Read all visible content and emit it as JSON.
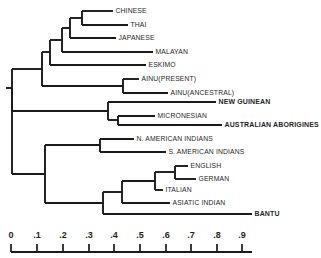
{
  "figure": {
    "type": "dendrogram"
  },
  "chart_data": {
    "type": "tree",
    "title": "",
    "xlabel": "",
    "ylabel": "",
    "xlim": [
      0,
      0.95
    ],
    "grid": false,
    "legend": null,
    "axis": {
      "tick_labels": [
        "0",
        ".1",
        ".2",
        ".3",
        ".4",
        ".5",
        ".6",
        ".7",
        ".8",
        ".9"
      ],
      "tick_values": [
        0,
        0.1,
        0.2,
        0.3,
        0.4,
        0.5,
        0.6,
        0.7,
        0.8,
        0.9
      ],
      "tick_px": [
        11,
        37,
        63,
        89,
        114,
        140,
        166,
        191,
        217,
        242
      ],
      "line_start_px": 11,
      "line_end_px": 252,
      "line_y_px": 252,
      "label_y_px": 238,
      "tick_top_px": 244,
      "tick_bottom_px": 252
    },
    "leaves": [
      {
        "label": "CHINESE",
        "y": 11,
        "x_end": 113,
        "bold": false
      },
      {
        "label": "THAI",
        "y": 25,
        "x_end": 128,
        "bold": false
      },
      {
        "label": "JAPANESE",
        "y": 38,
        "x_end": 116,
        "bold": false
      },
      {
        "label": "MALAYAN",
        "y": 52,
        "x_end": 153,
        "bold": false
      },
      {
        "label": "ESKIMO",
        "y": 65,
        "x_end": 146,
        "bold": false
      },
      {
        "label": "AINU(PRESENT)",
        "y": 79,
        "x_end": 139,
        "bold": false
      },
      {
        "label": "AINU(ANCESTRAL)",
        "y": 93,
        "x_end": 168,
        "bold": false
      },
      {
        "label": "NEW GUINEAN",
        "y": 102,
        "x_end": 216,
        "bold": true
      },
      {
        "label": "MICRONESIAN",
        "y": 116,
        "x_end": 155,
        "bold": false
      },
      {
        "label": "AUSTRALIAN ABORIGINES",
        "y": 125,
        "x_end": 222,
        "bold": true
      },
      {
        "label": "N. AMERICAN INDIANS",
        "y": 139,
        "x_end": 134,
        "bold": false
      },
      {
        "label": "S. AMERICAN INDIANS",
        "y": 152,
        "x_end": 166,
        "bold": false
      },
      {
        "label": "ENGLISH",
        "y": 166,
        "x_end": 188,
        "bold": false
      },
      {
        "label": "GERMAN",
        "y": 179,
        "x_end": 196,
        "bold": false
      },
      {
        "label": "ITALIAN",
        "y": 190,
        "x_end": 163,
        "bold": false
      },
      {
        "label": "ASIATIC INDIAN",
        "y": 203,
        "x_end": 170,
        "bold": false
      },
      {
        "label": "BANTU",
        "y": 214,
        "x_end": 252,
        "bold": true
      }
    ],
    "nodes": [
      {
        "name": "chinese-thai",
        "x": 82,
        "y_top": 11,
        "y_bot": 25
      },
      {
        "name": "chinese-thai-japanese",
        "x": 70,
        "y_top": 18,
        "y_bot": 38
      },
      {
        "name": "east-asian-malayan",
        "x": 62,
        "y_top": 28,
        "y_bot": 52
      },
      {
        "name": "asian-eskimo",
        "x": 50,
        "y_top": 40,
        "y_bot": 65
      },
      {
        "name": "ainu-pair",
        "x": 123,
        "y_top": 79,
        "y_bot": 93
      },
      {
        "name": "asian-ainu",
        "x": 42,
        "y_top": 52,
        "y_bot": 86
      },
      {
        "name": "micronesian-australian",
        "x": 118,
        "y_top": 116,
        "y_bot": 125
      },
      {
        "name": "oceanic",
        "x": 108,
        "y_top": 102,
        "y_bot": 120
      },
      {
        "name": "asian-oceanic",
        "x": 12,
        "y_top": 69,
        "y_bot": 111
      },
      {
        "name": "american-indians",
        "x": 100,
        "y_top": 139,
        "y_bot": 152
      },
      {
        "name": "english-german",
        "x": 175,
        "y_top": 166,
        "y_bot": 179
      },
      {
        "name": "euro-italian",
        "x": 155,
        "y_top": 172,
        "y_bot": 190
      },
      {
        "name": "euro-asiatic-indian",
        "x": 122,
        "y_top": 181,
        "y_bot": 203
      },
      {
        "name": "euro-bantu",
        "x": 103,
        "y_top": 192,
        "y_bot": 214
      },
      {
        "name": "american-euro",
        "x": 45,
        "y_top": 145,
        "y_bot": 203
      },
      {
        "name": "root",
        "x": 12,
        "y_top": 88,
        "y_bot": 174
      }
    ],
    "branches": [
      {
        "name": "chinese-leaf",
        "y": 11,
        "x_from": 82,
        "x_to": 113
      },
      {
        "name": "thai-leaf",
        "y": 25,
        "x_from": 82,
        "x_to": 128
      },
      {
        "name": "chinese-thai-stem",
        "y": 18,
        "x_from": 70,
        "x_to": 82
      },
      {
        "name": "japanese-leaf",
        "y": 38,
        "x_from": 70,
        "x_to": 116
      },
      {
        "name": "japanese-grp-stem",
        "y": 28,
        "x_from": 62,
        "x_to": 70
      },
      {
        "name": "malayan-leaf",
        "y": 52,
        "x_from": 62,
        "x_to": 153
      },
      {
        "name": "malayan-grp-stem",
        "y": 40,
        "x_from": 50,
        "x_to": 62
      },
      {
        "name": "eskimo-leaf",
        "y": 65,
        "x_from": 50,
        "x_to": 146
      },
      {
        "name": "eskimo-grp-stem",
        "y": 52,
        "x_from": 42,
        "x_to": 50
      },
      {
        "name": "ainu-present-leaf",
        "y": 79,
        "x_from": 123,
        "x_to": 139
      },
      {
        "name": "ainu-ancestral-leaf",
        "y": 93,
        "x_from": 123,
        "x_to": 168
      },
      {
        "name": "ainu-stem",
        "y": 86,
        "x_from": 42,
        "x_to": 123
      },
      {
        "name": "asian-stem",
        "y": 69,
        "x_from": 12,
        "x_to": 42
      },
      {
        "name": "new-guinean-leaf",
        "y": 102,
        "x_from": 108,
        "x_to": 216
      },
      {
        "name": "micronesian-leaf",
        "y": 116,
        "x_from": 118,
        "x_to": 155
      },
      {
        "name": "australian-leaf",
        "y": 125,
        "x_from": 118,
        "x_to": 222
      },
      {
        "name": "micro-aus-stem",
        "y": 120,
        "x_from": 108,
        "x_to": 118
      },
      {
        "name": "oceanic-stem",
        "y": 111,
        "x_from": 12,
        "x_to": 108
      },
      {
        "name": "n-american-leaf",
        "y": 139,
        "x_from": 100,
        "x_to": 134
      },
      {
        "name": "s-american-leaf",
        "y": 152,
        "x_from": 100,
        "x_to": 166
      },
      {
        "name": "american-stem",
        "y": 145,
        "x_from": 45,
        "x_to": 100
      },
      {
        "name": "english-leaf",
        "y": 166,
        "x_from": 175,
        "x_to": 188
      },
      {
        "name": "german-leaf",
        "y": 179,
        "x_from": 175,
        "x_to": 196
      },
      {
        "name": "eng-ger-stem",
        "y": 172,
        "x_from": 155,
        "x_to": 175
      },
      {
        "name": "italian-leaf",
        "y": 190,
        "x_from": 155,
        "x_to": 163
      },
      {
        "name": "euro-stem",
        "y": 181,
        "x_from": 122,
        "x_to": 155
      },
      {
        "name": "asiatic-indian-leaf",
        "y": 203,
        "x_from": 122,
        "x_to": 170
      },
      {
        "name": "euro-asiatic-stem",
        "y": 192,
        "x_from": 103,
        "x_to": 122
      },
      {
        "name": "bantu-leaf",
        "y": 214,
        "x_from": 103,
        "x_to": 252
      },
      {
        "name": "euro-bantu-stem",
        "y": 203,
        "x_from": 45,
        "x_to": 103
      },
      {
        "name": "american-euro-stem",
        "y": 174,
        "x_from": 12,
        "x_to": 45
      },
      {
        "name": "root-stem",
        "y": 88,
        "x_from": 6,
        "x_to": 12
      }
    ]
  }
}
